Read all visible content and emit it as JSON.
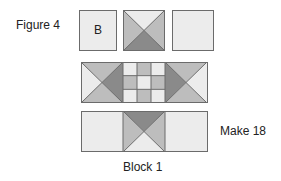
{
  "labels": {
    "figure": "Figure 4",
    "square_b": "B",
    "make": "Make 18",
    "block": "Block 1"
  },
  "colors": {
    "light": "#ececec",
    "medium": "#bdbdbd",
    "dark": "#8a8a8a",
    "outline": "#6b6b6b"
  },
  "diagram": {
    "row1": [
      "plain square B",
      "hourglass square (light top, medium sides, dark bottom)",
      "plain light square"
    ],
    "row2": [
      "flying geese unit pointing right",
      "nine-patch 3x3 checker",
      "flying geese unit pointing left"
    ],
    "row3": [
      "plain light rectangle",
      "hourglass square (dark top, medium sides, light bottom)",
      "plain light rectangle"
    ]
  }
}
